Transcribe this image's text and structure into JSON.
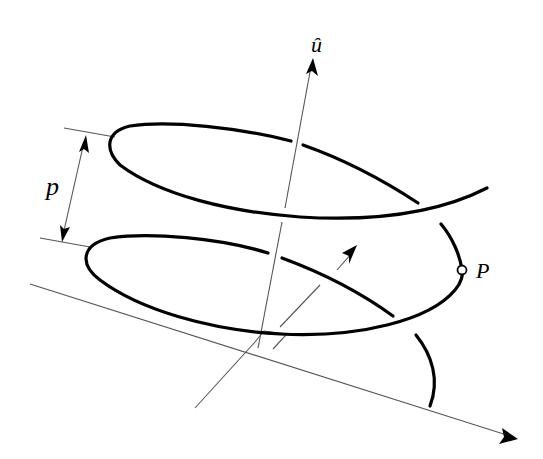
{
  "diagram": {
    "type": "helix-screw-geometry",
    "labels": {
      "axis_unit_vector": "û",
      "pitch": "p",
      "point": "P"
    },
    "elements": [
      {
        "name": "screw-axis",
        "description": "unit vector û along helix axis, arrow pointing up"
      },
      {
        "name": "helix-curve",
        "description": "thick helical curve wrapping around axis, ~2 turns"
      },
      {
        "name": "pitch-dimension",
        "description": "double-headed arrow between two ticks labeled p"
      },
      {
        "name": "point-P",
        "description": "hollow circle marker on helix labeled P"
      },
      {
        "name": "reference-line",
        "description": "long slanted line with arrow at lower right"
      },
      {
        "name": "perpendicular-vector",
        "description": "arrow from reference line toward helix, with right-angle marker"
      }
    ],
    "colors": {
      "curve": "#000000",
      "thin_lines": "#555555",
      "background": "#ffffff"
    }
  }
}
